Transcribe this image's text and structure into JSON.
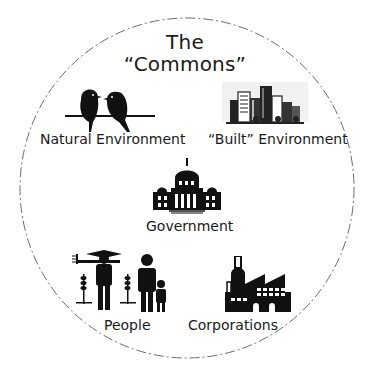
{
  "diagram": {
    "title_line1": "The",
    "title_line2": "“Commons”",
    "boundary": {
      "shape": "dashed-circle",
      "color": "#6b6b6b"
    },
    "items": [
      {
        "id": "natural",
        "label": "Natural Environment",
        "icon": "birds-on-wire-icon"
      },
      {
        "id": "built",
        "label": "“Built” Environment",
        "icon": "city-skyline-icon"
      },
      {
        "id": "government",
        "label": "Government",
        "icon": "capitol-building-icon"
      },
      {
        "id": "people",
        "label": "People",
        "icon": "people-family-icon"
      },
      {
        "id": "corporations",
        "label": "Corporations",
        "icon": "factory-icon"
      }
    ]
  }
}
